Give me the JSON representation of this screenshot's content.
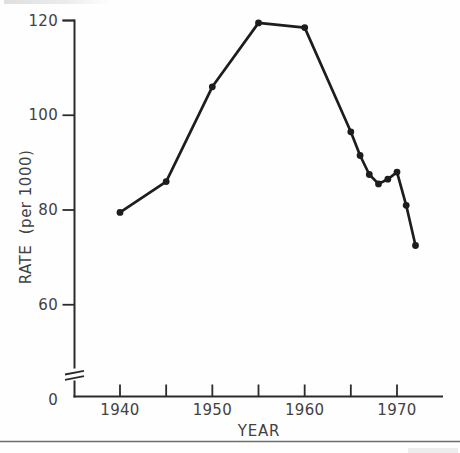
{
  "chart_data": {
    "type": "line",
    "title": "",
    "xlabel": "YEAR",
    "ylabel": "RATE  (per 1000)",
    "series": [
      {
        "name": "rate-per-1000",
        "x": [
          1940,
          1945,
          1950,
          1955,
          1960,
          1965,
          1966,
          1967,
          1968,
          1969,
          1970,
          1971,
          1972
        ],
        "y": [
          79.5,
          86,
          106,
          119.5,
          118.5,
          96.5,
          91.5,
          87.5,
          85.5,
          86.5,
          88,
          81,
          72.5
        ]
      }
    ],
    "xlim": [
      1935.2,
      1975
    ],
    "ylim": [
      0,
      120
    ],
    "yticks": [
      60,
      80,
      100,
      120
    ],
    "ytick_labels": [
      {
        "text": "0",
        "value": 0
      },
      {
        "text": "60",
        "value": 60
      },
      {
        "text": "80",
        "value": 80
      },
      {
        "text": "100",
        "value": 100
      },
      {
        "text": "120",
        "value": 120
      }
    ],
    "xticks": [
      1940,
      1945,
      1950,
      1955,
      1960,
      1965,
      1970
    ],
    "xtick_labels": [
      {
        "text": "1940",
        "value": 1940
      },
      {
        "text": "1950",
        "value": 1950
      },
      {
        "text": "1960",
        "value": 1960
      },
      {
        "text": "1970",
        "value": 1970
      }
    ],
    "y_axis_break": {
      "present": true,
      "between": [
        0,
        57
      ]
    },
    "grid": false,
    "legend": "none",
    "marker": "filled-circle",
    "colors": {
      "line": "#1d1d1d",
      "axis": "#2b2b2b",
      "text": "#424242",
      "bottom_rule": "#6e6e6e",
      "background": "#fefefe"
    }
  }
}
